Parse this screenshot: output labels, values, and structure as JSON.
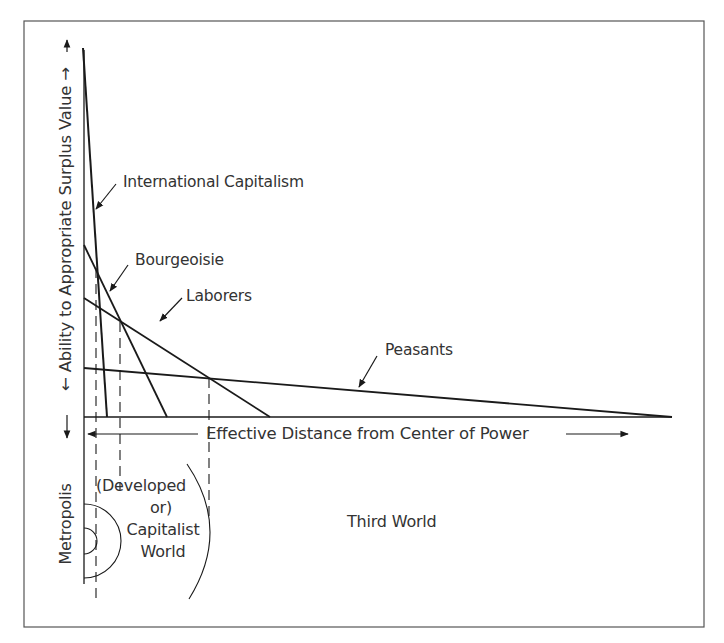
{
  "diagram": {
    "y_axis_label": "← Ability to Appropriate Surplus Value →",
    "x_axis_label": "Effective Distance from Center of Power",
    "series": [
      {
        "name": "International Capitalism",
        "start": [
          84,
          48
        ],
        "end": [
          107,
          417
        ]
      },
      {
        "name": "Bourgeoisie",
        "start": [
          84,
          245
        ],
        "end": [
          167,
          417
        ]
      },
      {
        "name": "Laborers",
        "start": [
          84,
          298
        ],
        "end": [
          270,
          417
        ]
      },
      {
        "name": "Peasants",
        "start": [
          84,
          368
        ],
        "end": [
          672,
          417
        ]
      }
    ],
    "zones": {
      "metropolis": "Metropolis",
      "developed_line1": "(Developed",
      "developed_line2": "or)",
      "developed_line3": "Capitalist",
      "developed_line4": "World",
      "third_world": "Third World"
    },
    "colors": {
      "line": "#1a1a1a",
      "text": "#333333",
      "border": "#555555",
      "background": "#ffffff"
    }
  }
}
